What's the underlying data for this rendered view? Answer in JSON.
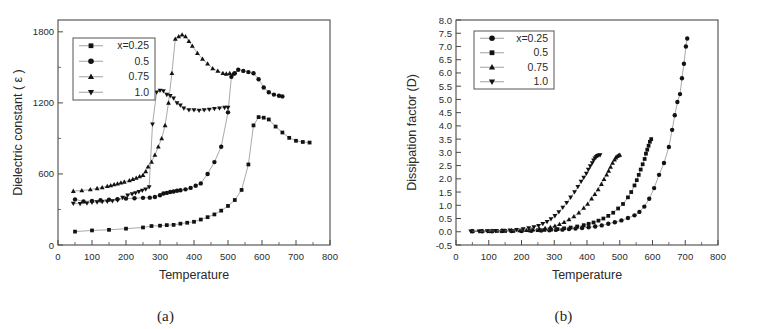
{
  "figure": {
    "caption_a": "(a)",
    "caption_b": "(b)"
  },
  "chart_data": [
    {
      "id": "panel-a",
      "type": "scatter",
      "title": "",
      "xlabel": "Temperature",
      "ylabel": "Dielectric constant ( ε )",
      "xlim": [
        0,
        800
      ],
      "ylim": [
        0,
        1900
      ],
      "xticks": [
        0,
        100,
        200,
        300,
        400,
        500,
        600,
        700,
        800
      ],
      "yticks": [
        0,
        600,
        1200,
        1800
      ],
      "yminor": [
        300,
        900,
        1500
      ],
      "grid": false,
      "legend_position": "upper-left",
      "legend_title": "",
      "series": [
        {
          "name": "x=0.25",
          "marker": "square",
          "x": [
            50,
            100,
            150,
            200,
            250,
            275,
            300,
            320,
            340,
            360,
            380,
            400,
            420,
            440,
            460,
            480,
            500,
            520,
            540,
            560,
            575,
            590,
            605,
            620,
            640,
            660,
            680,
            700,
            720,
            740
          ],
          "y": [
            113,
            123,
            128,
            138,
            148,
            160,
            163,
            168,
            170,
            180,
            188,
            196,
            215,
            235,
            258,
            290,
            330,
            380,
            465,
            680,
            1010,
            1080,
            1075,
            1060,
            1000,
            950,
            905,
            880,
            870,
            865
          ]
        },
        {
          "name": "0.5",
          "marker": "circle",
          "x": [
            50,
            75,
            100,
            125,
            150,
            175,
            200,
            225,
            250,
            270,
            285,
            300,
            310,
            320,
            330,
            340,
            350,
            360,
            375,
            390,
            405,
            420,
            440,
            460,
            480,
            500,
            510,
            520,
            530,
            545,
            560,
            575,
            590,
            605,
            620,
            635,
            650,
            660
          ],
          "y": [
            385,
            368,
            372,
            378,
            382,
            386,
            392,
            395,
            398,
            400,
            405,
            420,
            435,
            440,
            448,
            452,
            458,
            462,
            470,
            482,
            500,
            520,
            600,
            700,
            830,
            1120,
            1420,
            1450,
            1480,
            1470,
            1460,
            1450,
            1400,
            1330,
            1290,
            1270,
            1260,
            1255
          ]
        },
        {
          "name": "0.75",
          "marker": "triangle-up",
          "x": [
            45,
            70,
            95,
            115,
            130,
            145,
            155,
            165,
            175,
            185,
            195,
            210,
            220,
            230,
            240,
            250,
            258,
            265,
            275,
            285,
            295,
            305,
            315,
            325,
            335,
            345,
            355,
            365,
            375,
            385,
            395,
            410,
            425,
            440,
            455,
            470,
            485,
            495,
            505,
            515
          ],
          "y": [
            455,
            460,
            468,
            478,
            486,
            496,
            502,
            510,
            518,
            525,
            533,
            545,
            556,
            565,
            578,
            590,
            620,
            660,
            700,
            760,
            830,
            900,
            1010,
            1200,
            1450,
            1740,
            1760,
            1775,
            1760,
            1720,
            1680,
            1620,
            1570,
            1530,
            1490,
            1470,
            1450,
            1445,
            1450,
            1445
          ]
        },
        {
          "name": "1.0",
          "marker": "triangle-down",
          "x": [
            45,
            65,
            85,
            100,
            115,
            130,
            145,
            160,
            175,
            190,
            205,
            218,
            228,
            238,
            248,
            258,
            268,
            278,
            290,
            300,
            310,
            320,
            330,
            340,
            350,
            360,
            370,
            385,
            400,
            415,
            430,
            445,
            460,
            475,
            490,
            500
          ],
          "y": [
            350,
            348,
            352,
            360,
            362,
            365,
            368,
            372,
            378,
            400,
            420,
            430,
            440,
            450,
            460,
            470,
            490,
            1020,
            1290,
            1305,
            1300,
            1270,
            1260,
            1240,
            1200,
            1180,
            1155,
            1140,
            1140,
            1135,
            1140,
            1145,
            1150,
            1155,
            1160,
            1160
          ]
        }
      ]
    },
    {
      "id": "panel-b",
      "type": "scatter",
      "title": "",
      "xlabel": "Temperature",
      "ylabel": "Dissipation factor (D)",
      "xlim": [
        0,
        800
      ],
      "ylim": [
        -0.5,
        8.0
      ],
      "xticks": [
        0,
        100,
        200,
        300,
        400,
        500,
        600,
        700,
        800
      ],
      "yticks": [
        -0.5,
        0.0,
        0.5,
        1.0,
        1.5,
        2.0,
        2.5,
        3.0,
        3.5,
        4.0,
        4.5,
        5.0,
        5.5,
        6.0,
        6.5,
        7.0,
        7.5,
        8.0
      ],
      "grid": false,
      "legend_position": "upper-left",
      "legend_title": "",
      "series": [
        {
          "name": "x=0.25",
          "marker": "circle",
          "x": [
            50,
            80,
            110,
            140,
            170,
            200,
            230,
            260,
            285,
            305,
            325,
            345,
            365,
            385,
            405,
            425,
            445,
            465,
            485,
            505,
            525,
            545,
            560,
            575,
            590,
            605,
            620,
            635,
            650,
            660,
            668,
            676,
            684,
            690,
            696,
            702,
            706
          ],
          "y": [
            0.02,
            0.02,
            0.02,
            0.03,
            0.03,
            0.03,
            0.04,
            0.05,
            0.06,
            0.07,
            0.08,
            0.1,
            0.12,
            0.14,
            0.17,
            0.2,
            0.24,
            0.3,
            0.36,
            0.43,
            0.52,
            0.62,
            0.75,
            0.95,
            1.25,
            1.65,
            2.15,
            2.6,
            3.2,
            3.85,
            4.4,
            4.9,
            5.2,
            5.8,
            6.35,
            7.0,
            7.3
          ]
        },
        {
          "name": "0.5",
          "marker": "square",
          "x": [
            50,
            75,
            100,
            125,
            150,
            175,
            200,
            225,
            250,
            270,
            290,
            310,
            330,
            350,
            370,
            390,
            405,
            420,
            435,
            450,
            465,
            480,
            495,
            510,
            525,
            535,
            545,
            552,
            558,
            564,
            570,
            576,
            580,
            584,
            588,
            592,
            596
          ],
          "y": [
            0.02,
            0.02,
            0.02,
            0.03,
            0.03,
            0.03,
            0.04,
            0.05,
            0.06,
            0.07,
            0.08,
            0.1,
            0.13,
            0.16,
            0.2,
            0.25,
            0.3,
            0.35,
            0.42,
            0.5,
            0.6,
            0.72,
            0.88,
            1.05,
            1.3,
            1.5,
            1.75,
            1.95,
            2.15,
            2.35,
            2.55,
            2.75,
            2.95,
            3.1,
            3.25,
            3.4,
            3.5
          ]
        },
        {
          "name": "0.75",
          "marker": "triangle-up",
          "x": [
            50,
            80,
            110,
            140,
            170,
            195,
            215,
            235,
            255,
            272,
            288,
            302,
            316,
            330,
            345,
            360,
            375,
            390,
            402,
            414,
            424,
            434,
            444,
            452,
            460,
            466,
            472,
            478,
            484,
            488,
            492,
            496,
            500
          ],
          "y": [
            0.02,
            0.02,
            0.03,
            0.03,
            0.04,
            0.05,
            0.06,
            0.08,
            0.1,
            0.13,
            0.17,
            0.22,
            0.28,
            0.36,
            0.46,
            0.58,
            0.72,
            0.9,
            1.05,
            1.25,
            1.42,
            1.6,
            1.8,
            1.98,
            2.15,
            2.3,
            2.45,
            2.6,
            2.72,
            2.8,
            2.85,
            2.88,
            2.9
          ]
        },
        {
          "name": "1.0",
          "marker": "triangle-down",
          "x": [
            45,
            70,
            95,
            120,
            145,
            165,
            185,
            205,
            222,
            238,
            252,
            265,
            278,
            290,
            302,
            314,
            326,
            338,
            350,
            362,
            372,
            382,
            390,
            398,
            404,
            410,
            416,
            420,
            424,
            428,
            432,
            436,
            440
          ],
          "y": [
            0.02,
            0.02,
            0.03,
            0.04,
            0.05,
            0.06,
            0.08,
            0.1,
            0.14,
            0.18,
            0.23,
            0.3,
            0.38,
            0.48,
            0.6,
            0.75,
            0.92,
            1.1,
            1.3,
            1.5,
            1.7,
            1.9,
            2.05,
            2.2,
            2.35,
            2.48,
            2.6,
            2.7,
            2.78,
            2.83,
            2.87,
            2.89,
            2.9
          ]
        }
      ]
    }
  ]
}
